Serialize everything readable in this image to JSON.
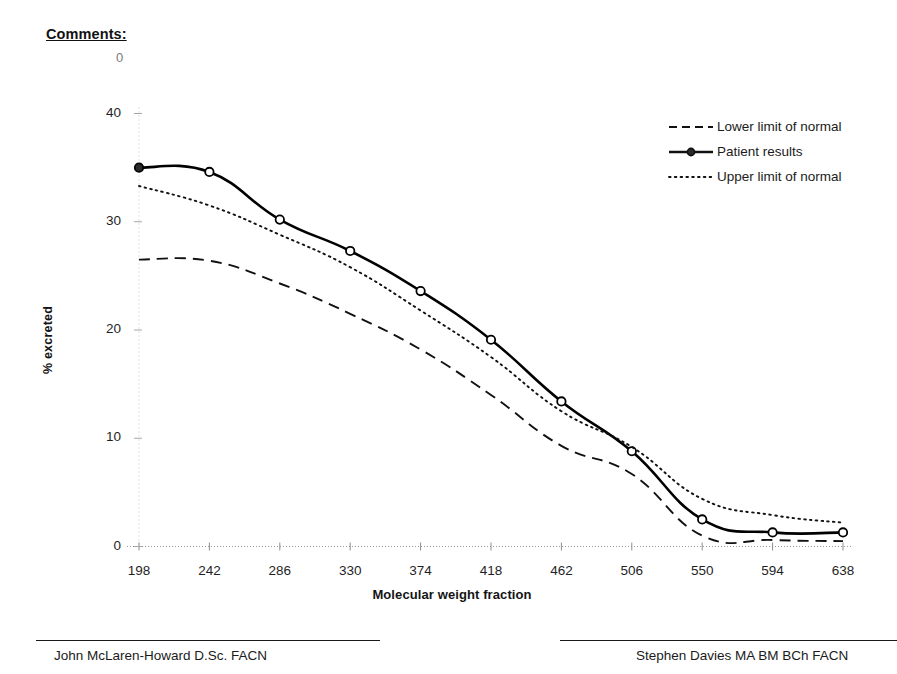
{
  "header": {
    "comments_label": "Comments:",
    "stray_mark": "0"
  },
  "chart_data": {
    "type": "line",
    "title": "",
    "xlabel": "Molecular weight fraction",
    "ylabel": "% excreted",
    "categories": [
      198,
      242,
      286,
      330,
      374,
      418,
      462,
      506,
      550,
      594,
      638
    ],
    "x_tick_labels": [
      "198",
      "242",
      "286",
      "330",
      "374",
      "418",
      "462",
      "506",
      "550",
      "594",
      "638"
    ],
    "y_tick_labels": [
      "0",
      "10",
      "20",
      "30",
      "40"
    ],
    "y_ticks": [
      0,
      10,
      20,
      30,
      40
    ],
    "ylim": [
      0,
      40
    ],
    "grid": false,
    "legend_position": "top-right",
    "series": [
      {
        "name": "Lower limit of normal",
        "style": "dashed",
        "markers": false,
        "color": "#111111",
        "values": [
          26.5,
          26.4,
          24.3,
          21.5,
          18.2,
          14.0,
          9.3,
          6.7,
          1.0,
          0.6,
          0.5
        ]
      },
      {
        "name": "Patient results",
        "style": "solid",
        "markers": true,
        "color": "#000000",
        "values": [
          35.0,
          34.6,
          30.2,
          27.3,
          23.6,
          19.1,
          13.4,
          8.8,
          2.5,
          1.3,
          1.3
        ]
      },
      {
        "name": "Upper limit of normal",
        "style": "dotted",
        "markers": false,
        "color": "#111111",
        "values": [
          33.3,
          31.5,
          28.8,
          25.8,
          21.8,
          17.5,
          12.5,
          9.2,
          4.4,
          2.9,
          2.2
        ]
      }
    ]
  },
  "legend": {
    "items": [
      {
        "label": "Lower limit of normal",
        "style": "dashed"
      },
      {
        "label": "Patient results",
        "style": "solid-marker"
      },
      {
        "label": "Upper limit of normal",
        "style": "dotted"
      }
    ]
  },
  "footer": {
    "left_signatory": "John McLaren-Howard D.Sc. FACN",
    "right_signatory": "Stephen Davies MA BM BCh FACN"
  }
}
